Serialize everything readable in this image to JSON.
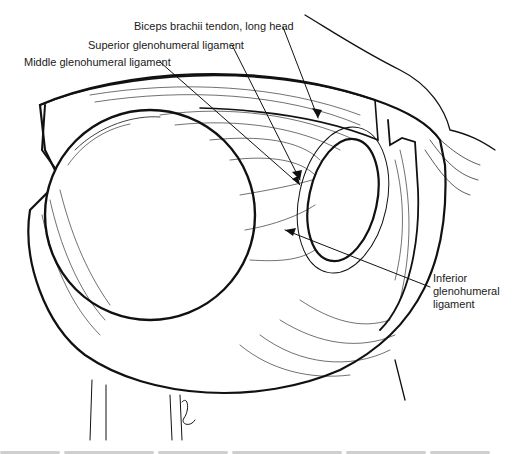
{
  "figure": {
    "labels": [
      {
        "id": "biceps",
        "text": "Biceps brachii tendon, long head",
        "x": 134,
        "y": 20
      },
      {
        "id": "superior",
        "text": "Superior glenohumeral ligament",
        "x": 88,
        "y": 40
      },
      {
        "id": "middle",
        "text": "Middle glenohumeral ligament",
        "x": 24,
        "y": 57
      },
      {
        "id": "inferior",
        "lines": [
          "Inferior",
          "glenohumeral",
          "ligament"
        ],
        "x": 433,
        "y": 273
      }
    ],
    "colors": {
      "ink": "#111111",
      "background": "#ffffff",
      "caption": "#cfcfcf"
    },
    "signature": "artist signature"
  }
}
